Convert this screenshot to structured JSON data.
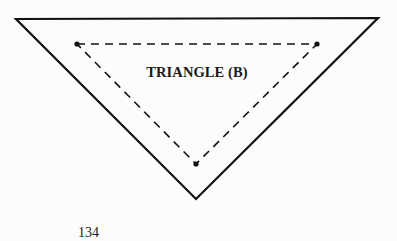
{
  "figure": {
    "label": "TRIANGLE (B)",
    "outer_triangle": {
      "style": "solid",
      "vertices": [
        [
          16,
          19
        ],
        [
          378,
          18
        ],
        [
          196,
          199
        ]
      ],
      "stroke": "#111111",
      "stroke_width": 2.2
    },
    "inner_triangle": {
      "style": "dashed",
      "vertices": [
        [
          77,
          44
        ],
        [
          317,
          44
        ],
        [
          196,
          164
        ]
      ],
      "stroke": "#111111",
      "stroke_width": 1.6,
      "dash": "8 6",
      "vertex_markers": "dot"
    }
  },
  "page": {
    "number": "134"
  }
}
